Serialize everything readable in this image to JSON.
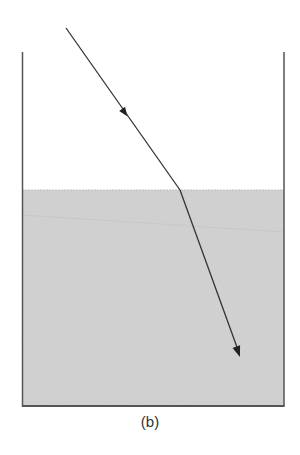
{
  "figure": {
    "caption": "(b)"
  },
  "container": {
    "left_x": 22,
    "right_x": 284,
    "top_y": 52,
    "bottom_y": 406,
    "wall_color": "#555555"
  },
  "water": {
    "surface_y": 190,
    "fill_color": "#d4d4d4",
    "surface_color": "#bdbdbd"
  },
  "ray": {
    "incident": {
      "start": [
        66,
        28
      ],
      "end": [
        180,
        190
      ]
    },
    "refracted": {
      "start": [
        180,
        190
      ],
      "end": [
        240,
        357
      ]
    },
    "color": "#333333",
    "arrows": [
      {
        "name": "incident-arrow",
        "at": [
          123,
          110
        ]
      },
      {
        "name": "refracted-arrow",
        "tip": [
          240,
          357
        ]
      }
    ]
  }
}
